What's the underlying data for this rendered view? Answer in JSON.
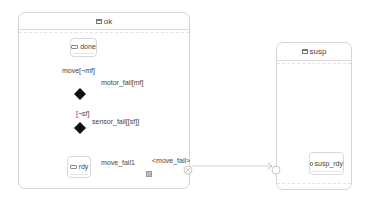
{
  "diagram": {
    "states": [
      {
        "id": "ok",
        "label": "ok",
        "icon": "composite-state-icon",
        "substates": [
          {
            "id": "done",
            "label": "done",
            "icon": "state-icon"
          },
          {
            "id": "rdy",
            "label": "rdy",
            "icon": "state-icon"
          }
        ]
      },
      {
        "id": "susp",
        "label": "susp",
        "icon": "composite-state-icon",
        "substates": [
          {
            "id": "susp_rdy",
            "label": "susp_rdy",
            "icon": "state-icon"
          }
        ]
      }
    ],
    "transitions": {
      "move_not_mf": "move[¬mf]",
      "motor_fail_mf": "motor_fail[mf]",
      "not_sf": "[¬sf]",
      "sensor_fail_sf": "sensor_fail[[sf]]",
      "move_fail1": "move_fail1",
      "exit_point": "<move_fail>"
    },
    "colors": {
      "border": "#d4d4d4",
      "line": "#c8c8c8",
      "choice": "#111111",
      "text": "#444444"
    }
  }
}
